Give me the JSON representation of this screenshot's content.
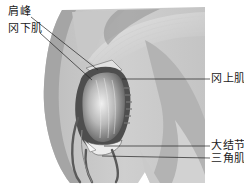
{
  "figure": {
    "palette": {
      "background": "#ffffff",
      "light_tissue": "#d9d9d9",
      "mid_tissue": "#a8a8a8",
      "dark_tissue": "#5a5a5a",
      "outline": "#3a3a3a",
      "leader_line": "#222222",
      "label_text": "#1a1a1a"
    },
    "labels": [
      {
        "id": "acromion",
        "text": "肩峰",
        "side": "left"
      },
      {
        "id": "infraspinatus",
        "text": "冈下肌",
        "side": "left"
      },
      {
        "id": "supraspinatus",
        "text": "冈上肌",
        "side": "right"
      },
      {
        "id": "greater-tuberosity",
        "text": "大结节",
        "side": "right"
      },
      {
        "id": "deltoid",
        "text": "三角肌",
        "side": "right"
      }
    ]
  }
}
